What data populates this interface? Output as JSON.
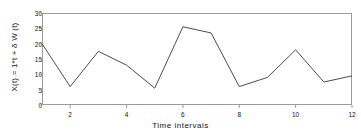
{
  "chart_data": {
    "type": "line",
    "title": "",
    "xlabel": "Time intervals",
    "ylabel": "X(t) = 1*t + δ W (t)",
    "x": [
      1,
      2,
      3,
      4,
      5,
      6,
      7,
      8,
      9,
      10,
      11,
      12
    ],
    "values": [
      20,
      6,
      17.5,
      13,
      5.5,
      25.5,
      23.5,
      6,
      9,
      18,
      7.5,
      9.5
    ],
    "series": [
      {
        "name": "X(t)",
        "values": [
          20,
          6,
          17.5,
          13,
          5.5,
          25.5,
          23.5,
          6,
          9,
          18,
          7.5,
          9.5
        ]
      }
    ],
    "xlim": [
      1,
      12
    ],
    "ylim": [
      0,
      30
    ],
    "xticks": [
      2,
      4,
      6,
      8,
      10,
      12
    ],
    "xtick_labels": [
      "2",
      "4",
      "6",
      "8",
      "10",
      "12"
    ],
    "yticks": [
      0,
      5,
      10,
      15,
      20,
      25,
      30
    ],
    "ytick_labels": [
      "0",
      "5",
      "10",
      "15",
      "20",
      "25",
      "30"
    ],
    "grid": false,
    "legend": false,
    "line_color": "#4a4a52",
    "frame_color": "#9a9a9a",
    "background_color": "#ffffff"
  },
  "figure": {
    "name": "brownian-motion-line-chart"
  }
}
